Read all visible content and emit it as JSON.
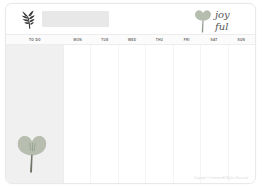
{
  "page": {
    "background_color": "#ffffff",
    "card_color": "#ffffff",
    "accent_color": "#a8b49c",
    "panel_color": "#f0f0f0"
  },
  "header": {
    "leaf_icon_name": "leaf-sprig-icon",
    "title_field_value": "",
    "title_field_placeholder": "",
    "brand": {
      "line1": "joy",
      "line2": "ful",
      "flower_icon_name": "tulip-flower-icon",
      "color": "#9aa893"
    }
  },
  "columns": {
    "todo_label": "TO DO",
    "days": [
      {
        "label": "mon"
      },
      {
        "label": "tue"
      },
      {
        "label": "wed"
      },
      {
        "label": "thu"
      },
      {
        "label": "fri"
      },
      {
        "label": "sat"
      },
      {
        "label": "sun"
      }
    ]
  },
  "sidebar": {
    "flower_icon_name": "flower-illustration",
    "entries": [
      "",
      "",
      "",
      "",
      "",
      "",
      "",
      "",
      "",
      "",
      "",
      ""
    ]
  },
  "footer": {
    "copyright": "Copyright © mmmmm All Rights Reserved"
  }
}
